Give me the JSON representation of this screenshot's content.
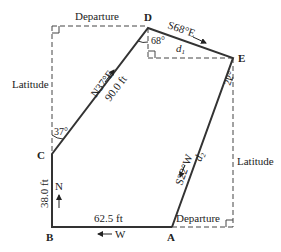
{
  "diagram": {
    "vertices": [
      {
        "id": "A",
        "label": "A"
      },
      {
        "id": "B",
        "label": "B"
      },
      {
        "id": "C",
        "label": "C"
      },
      {
        "id": "D",
        "label": "D"
      },
      {
        "id": "E",
        "label": "E"
      }
    ],
    "courses": {
      "AB": {
        "direction": "W",
        "length": "62.5 ft"
      },
      "BC": {
        "direction": "N",
        "length": "38.0 ft"
      },
      "CD": {
        "bearing": "N37°E",
        "length": "90.0 ft"
      },
      "DE": {
        "bearing": "S68°E",
        "length": "d1",
        "length_main": "d",
        "length_sub": "1"
      },
      "EA": {
        "bearing": "S22°W",
        "length": "d2",
        "length_main": "d",
        "length_sub": "2"
      }
    },
    "angles": {
      "C": "37°",
      "D": "68°",
      "E": "22°"
    },
    "component_labels": {
      "departure_top": "Departure",
      "latitude_left": "Latitude",
      "latitude_right": "Latitude",
      "departure_bottom": "Departure"
    }
  }
}
